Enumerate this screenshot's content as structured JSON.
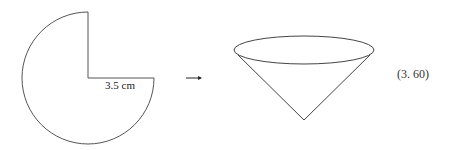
{
  "diagram": {
    "sector": {
      "radius_label": "3.5 cm",
      "angle_degrees": 270,
      "stroke_color": "#555555"
    },
    "arrow": {
      "glyph": "→"
    },
    "cone": {
      "stroke_color": "#444444"
    },
    "answer": {
      "label": "(3. 60)"
    }
  }
}
